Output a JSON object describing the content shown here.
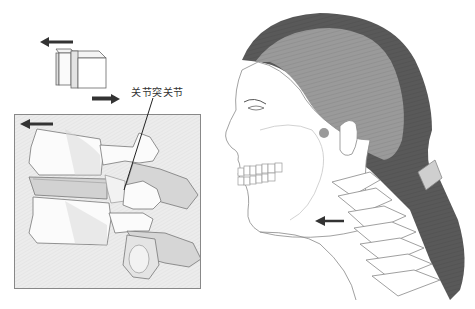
{
  "figure": {
    "left_panel": {
      "motion_icon": {
        "arrow_top_direction": "left",
        "arrow_bottom_direction": "right",
        "description": "two sliding blocks"
      },
      "callout_label": "关节突关节",
      "vertebra_box": {
        "arrow_direction": "left",
        "description": "lateral view of two vertebrae with facet joint"
      }
    },
    "right_panel": {
      "description": "head and neck profile with cervical spine",
      "arrow_direction": "left"
    },
    "colors": {
      "hair_dark": "#5a5a5a",
      "hair_light": "#9a9a9a",
      "line": "#777777",
      "arrow": "#333333",
      "box_border": "#888888",
      "box_fill": "#ededed"
    }
  }
}
